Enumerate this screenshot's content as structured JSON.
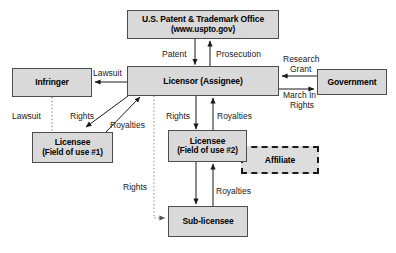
{
  "diagram": {
    "nodes": {
      "uspto": {
        "line1": "U.S. Patent & Trademark Office",
        "line2": "(www.uspto.gov)"
      },
      "infringer": {
        "line1": "Infringer"
      },
      "licensor": {
        "line1": "Licensor (Assignee)"
      },
      "government": {
        "line1": "Government"
      },
      "licensee1": {
        "line1": "Licensee",
        "line2": "(Field of use #1)"
      },
      "licensee2": {
        "line1": "Licensee",
        "line2": "(Field of use #2)"
      },
      "affiliate": {
        "line1": "Affiliate"
      },
      "sublicensee": {
        "line1": "Sub-licensee"
      }
    },
    "edge_labels": {
      "patent": "Patent",
      "prosecution": "Prosecution",
      "lawsuit_top": "Lawsuit",
      "research_grant_l1": "Research",
      "research_grant_l2": "Grant",
      "march_in_l1": "March In",
      "march_in_l2": "Rights",
      "lawsuit_left": "Lawsuit",
      "rights_left": "Rights",
      "royalties_left": "Royalties",
      "rights_mid": "Rights",
      "royalties_mid": "Royalties",
      "rights_lower": "Rights",
      "royalties_lower": "Royalties"
    },
    "colors": {
      "node_fill": "#d9d9d9",
      "node_border": "#4d4d4d",
      "affiliate_border": "#1a1a1a",
      "line": "#1a1a1a",
      "background": "#ffffff"
    }
  }
}
